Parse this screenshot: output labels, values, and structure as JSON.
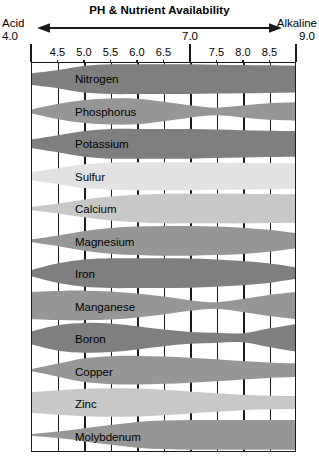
{
  "header": {
    "title": "PH & Nutrient Availability",
    "left_label": "Acid",
    "left_value": "4.0",
    "right_label": "Alkaline",
    "right_value": "9.0",
    "mid_value": "7.0"
  },
  "axis": {
    "tick_labels": [
      "4.5",
      "5.0",
      "5.5",
      "6.0",
      "6.5",
      "7.5",
      "8.0",
      "8.5"
    ],
    "all_ticks": [
      "4.0",
      "4.5",
      "5.0",
      "5.5",
      "6.0",
      "6.5",
      "7.0",
      "7.5",
      "8.0",
      "8.5",
      "9.0"
    ],
    "min": 4.0,
    "max": 9.0,
    "step": 0.5
  },
  "colors": {
    "dark_gray": "#7f7f7f",
    "mid_gray": "#969696",
    "light_gray": "#c8c8c8",
    "pale_gray": "#e2e2e2",
    "border": "#1a1a1a",
    "background": "#ffffff"
  },
  "chart_data": {
    "type": "area",
    "title": "PH & Nutrient Availability",
    "xlabel": "pH",
    "ylabel": "Nutrient",
    "xlim": [
      4.0,
      9.0
    ],
    "grid": true,
    "legend": "none",
    "note": "Band thickness at each pH encodes relative nutrient availability (0-1).",
    "x": [
      4.0,
      4.5,
      5.0,
      5.5,
      6.0,
      6.5,
      7.0,
      7.5,
      8.0,
      8.5,
      9.0
    ],
    "series": [
      {
        "name": "Nitrogen",
        "shade": "dark",
        "values": [
          0.4,
          0.62,
          0.9,
          1.0,
          1.0,
          1.0,
          1.0,
          0.97,
          0.95,
          0.93,
          0.9
        ]
      },
      {
        "name": "Phosphorus",
        "shade": "mid",
        "values": [
          0.14,
          0.52,
          0.78,
          0.88,
          0.86,
          0.66,
          0.42,
          0.26,
          0.4,
          0.56,
          0.62
        ]
      },
      {
        "name": "Potassium",
        "shade": "dark",
        "values": [
          0.3,
          0.58,
          0.86,
          1.0,
          1.0,
          1.0,
          1.0,
          0.96,
          0.92,
          0.88,
          0.86
        ]
      },
      {
        "name": "Sulfur",
        "shade": "pale",
        "values": [
          0.28,
          0.54,
          0.8,
          0.92,
          0.94,
          0.94,
          0.94,
          0.92,
          0.9,
          0.88,
          0.86
        ]
      },
      {
        "name": "Calcium",
        "shade": "light",
        "values": [
          0.12,
          0.34,
          0.6,
          0.8,
          0.92,
          1.0,
          1.0,
          1.0,
          1.0,
          0.98,
          0.96
        ]
      },
      {
        "name": "Magnesium",
        "shade": "mid",
        "values": [
          0.1,
          0.36,
          0.66,
          0.86,
          0.96,
          1.0,
          1.0,
          0.96,
          0.88,
          0.74,
          0.52
        ]
      },
      {
        "name": "Iron",
        "shade": "dark",
        "values": [
          0.22,
          0.66,
          0.92,
          1.0,
          1.0,
          1.0,
          0.98,
          0.92,
          0.82,
          0.66,
          0.4
        ]
      },
      {
        "name": "Manganese",
        "shade": "mid",
        "values": [
          0.92,
          0.98,
          1.0,
          0.94,
          0.8,
          0.6,
          0.36,
          0.22,
          0.44,
          0.7,
          0.9
        ]
      },
      {
        "name": "Boron",
        "shade": "dark",
        "values": [
          0.44,
          0.86,
          1.0,
          0.96,
          0.78,
          0.56,
          0.4,
          0.34,
          0.3,
          0.62,
          0.92
        ]
      },
      {
        "name": "Copper",
        "shade": "mid",
        "values": [
          0.08,
          0.44,
          0.8,
          0.94,
          0.96,
          0.92,
          0.84,
          0.74,
          0.62,
          0.52,
          0.46
        ]
      },
      {
        "name": "Zinc",
        "shade": "light",
        "values": [
          0.7,
          0.82,
          0.92,
          0.96,
          0.94,
          0.86,
          0.74,
          0.62,
          0.52,
          0.46,
          0.44
        ]
      },
      {
        "name": "Molybdenum",
        "shade": "mid",
        "values": [
          0.06,
          0.22,
          0.44,
          0.66,
          0.86,
          0.96,
          1.0,
          1.0,
          1.0,
          1.0,
          1.0
        ]
      }
    ]
  }
}
